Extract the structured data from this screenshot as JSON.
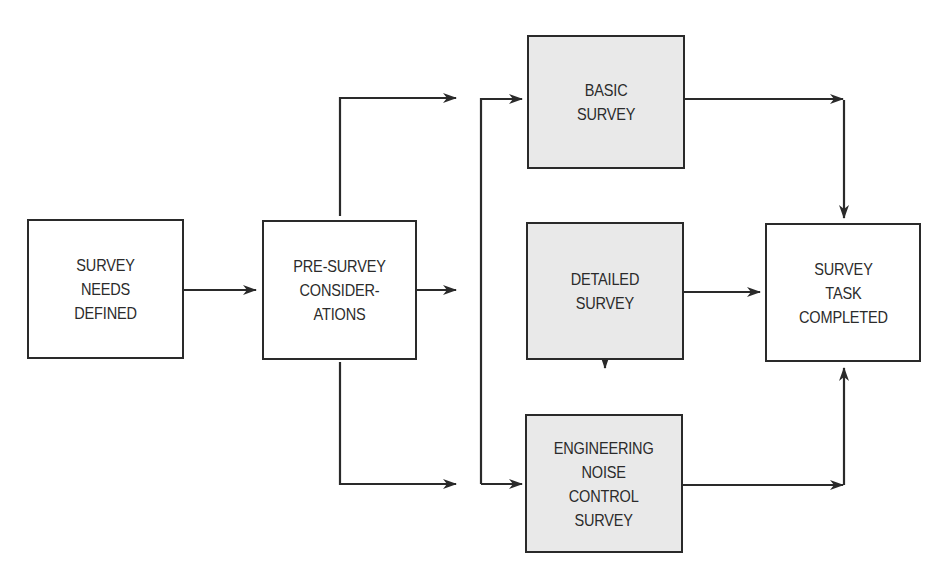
{
  "diagram": {
    "type": "flowchart",
    "colors": {
      "line": "#2a2a2a",
      "shaded_fill": "#e9e9e9",
      "plain_fill": "#ffffff",
      "text": "#2b2b2b"
    },
    "nodes": [
      {
        "id": "survey-needs-defined",
        "lines": [
          "SURVEY",
          "NEEDS",
          "DEFINED"
        ],
        "shaded": false
      },
      {
        "id": "pre-survey-considerations",
        "lines": [
          "PRE-SURVEY",
          "CONSIDER-",
          "ATIONS"
        ],
        "shaded": false
      },
      {
        "id": "basic-survey",
        "lines": [
          "BASIC",
          "SURVEY"
        ],
        "shaded": true
      },
      {
        "id": "detailed-survey",
        "lines": [
          "DETAILED",
          "SURVEY"
        ],
        "shaded": true
      },
      {
        "id": "engineering-noise-control-survey",
        "lines": [
          "ENGINEERING",
          "NOISE",
          "CONTROL",
          "SURVEY"
        ],
        "shaded": true
      },
      {
        "id": "survey-task-completed",
        "lines": [
          "SURVEY",
          "TASK",
          "COMPLETED"
        ],
        "shaded": false
      }
    ],
    "edges": [
      {
        "from": "survey-needs-defined",
        "to": "pre-survey-considerations",
        "type": "arrow"
      },
      {
        "from": "pre-survey-considerations",
        "to": "basic-survey",
        "type": "arrow"
      },
      {
        "from": "pre-survey-considerations",
        "to": "detailed-survey",
        "type": "arrow"
      },
      {
        "from": "pre-survey-considerations",
        "to": "engineering-noise-control-survey",
        "type": "arrow"
      },
      {
        "from": "basic-survey",
        "to": "detailed-survey",
        "type": "bidirectional"
      },
      {
        "from": "detailed-survey",
        "to": "engineering-noise-control-survey",
        "type": "bidirectional"
      },
      {
        "from": "engineering-noise-control-survey",
        "to": "basic-survey",
        "type": "arrow"
      },
      {
        "from": "basic-survey",
        "to": "survey-task-completed",
        "type": "arrow"
      },
      {
        "from": "detailed-survey",
        "to": "survey-task-completed",
        "type": "arrow"
      },
      {
        "from": "engineering-noise-control-survey",
        "to": "survey-task-completed",
        "type": "arrow"
      }
    ]
  }
}
